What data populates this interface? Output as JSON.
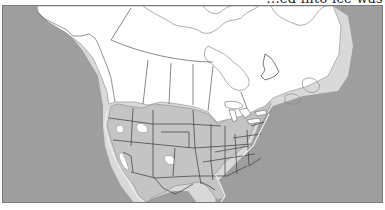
{
  "page": {
    "cropped_caption": "...ed into ice was"
  },
  "map": {
    "title": "",
    "subject": "North America glacial ice extent",
    "colors": {
      "ocean": "#9e9e9e",
      "ice_sheet": "#ffffff",
      "unglaciated_land": "#c4c4c4",
      "exposed_shelf": "#d9d9d9",
      "border_lines": "#3a3a3a",
      "coast_lines": "#8a8a8a"
    },
    "legend": []
  }
}
